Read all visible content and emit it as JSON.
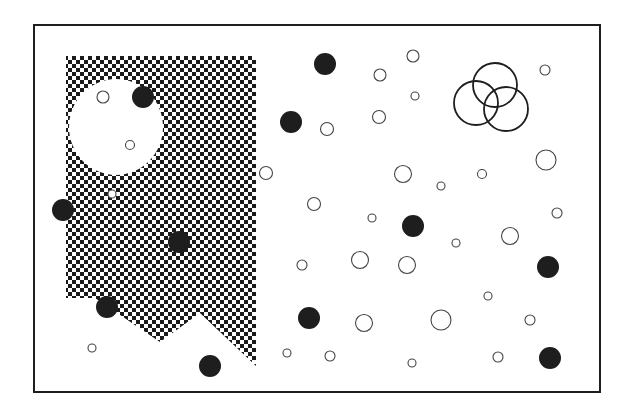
{
  "canvas": {
    "width": 631,
    "height": 415,
    "background": "#ffffff"
  },
  "colors": {
    "ink": "#1e1e1e",
    "stroke": "#444444",
    "checker": "#1a1a1a"
  },
  "frame": {
    "x": 34,
    "y": 25,
    "width": 566,
    "height": 367,
    "stroke_width": 2
  },
  "checker_region": {
    "cell": 4,
    "polygon": [
      [
        66,
        56
      ],
      [
        256,
        56
      ],
      [
        256,
        366
      ],
      [
        200,
        313
      ],
      [
        160,
        342
      ],
      [
        95,
        298
      ],
      [
        66,
        298
      ]
    ],
    "hole": {
      "cx": 116,
      "cy": 127,
      "rx": 47,
      "ry": 48
    }
  },
  "overlapping_circles": [
    {
      "cx": 495,
      "cy": 85,
      "r": 22
    },
    {
      "cx": 476,
      "cy": 103,
      "r": 22
    },
    {
      "cx": 506,
      "cy": 109,
      "r": 22
    }
  ],
  "filled_circles": [
    {
      "cx": 143,
      "cy": 97,
      "r": 11
    },
    {
      "cx": 325,
      "cy": 64,
      "r": 11
    },
    {
      "cx": 291,
      "cy": 122,
      "r": 11
    },
    {
      "cx": 63,
      "cy": 210,
      "r": 11
    },
    {
      "cx": 179,
      "cy": 242,
      "r": 11
    },
    {
      "cx": 413,
      "cy": 226,
      "r": 11
    },
    {
      "cx": 548,
      "cy": 267,
      "r": 11
    },
    {
      "cx": 107,
      "cy": 307,
      "r": 11
    },
    {
      "cx": 309,
      "cy": 318,
      "r": 11
    },
    {
      "cx": 210,
      "cy": 366,
      "r": 11
    },
    {
      "cx": 550,
      "cy": 358,
      "r": 11
    }
  ],
  "open_circles": [
    {
      "cx": 103,
      "cy": 97,
      "r": 6
    },
    {
      "cx": 130,
      "cy": 145,
      "r": 4.5
    },
    {
      "cx": 112,
      "cy": 194,
      "r": 4
    },
    {
      "cx": 413,
      "cy": 56,
      "r": 6
    },
    {
      "cx": 380,
      "cy": 75,
      "r": 6
    },
    {
      "cx": 415,
      "cy": 96,
      "r": 4
    },
    {
      "cx": 545,
      "cy": 70,
      "r": 5
    },
    {
      "cx": 379,
      "cy": 117,
      "r": 6.5
    },
    {
      "cx": 327,
      "cy": 129,
      "r": 6.5
    },
    {
      "cx": 546,
      "cy": 160,
      "r": 10
    },
    {
      "cx": 266,
      "cy": 173,
      "r": 6.5
    },
    {
      "cx": 403,
      "cy": 174,
      "r": 8.5
    },
    {
      "cx": 482,
      "cy": 174,
      "r": 4.5
    },
    {
      "cx": 441,
      "cy": 186,
      "r": 4
    },
    {
      "cx": 314,
      "cy": 204,
      "r": 6.5
    },
    {
      "cx": 557,
      "cy": 213,
      "r": 5
    },
    {
      "cx": 372,
      "cy": 218,
      "r": 4
    },
    {
      "cx": 510,
      "cy": 236,
      "r": 8.5
    },
    {
      "cx": 456,
      "cy": 243,
      "r": 4
    },
    {
      "cx": 360,
      "cy": 260,
      "r": 8.5
    },
    {
      "cx": 407,
      "cy": 265,
      "r": 8.5
    },
    {
      "cx": 302,
      "cy": 265,
      "r": 5
    },
    {
      "cx": 488,
      "cy": 296,
      "r": 4
    },
    {
      "cx": 441,
      "cy": 320,
      "r": 10
    },
    {
      "cx": 364,
      "cy": 323,
      "r": 8.5
    },
    {
      "cx": 530,
      "cy": 320,
      "r": 5
    },
    {
      "cx": 92,
      "cy": 348,
      "r": 4
    },
    {
      "cx": 287,
      "cy": 353,
      "r": 4
    },
    {
      "cx": 330,
      "cy": 356,
      "r": 5
    },
    {
      "cx": 498,
      "cy": 357,
      "r": 5
    },
    {
      "cx": 412,
      "cy": 363,
      "r": 4
    }
  ]
}
